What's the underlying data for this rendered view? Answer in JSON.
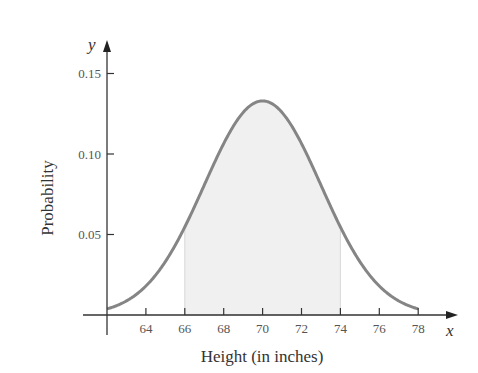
{
  "chart_data": {
    "type": "area",
    "title": "",
    "xlabel": "Height (in inches)",
    "ylabel": "Probability",
    "x_axis_var": "x",
    "y_axis_var": "y",
    "x_ticks": [
      64,
      66,
      68,
      70,
      72,
      74,
      76,
      78
    ],
    "y_ticks": [
      "0.05",
      "0.10",
      "0.15"
    ],
    "xlim": [
      62,
      80
    ],
    "ylim": [
      0,
      0.16
    ],
    "grid": false,
    "legend": null,
    "distribution": {
      "kind": "normal",
      "mean": 70,
      "sd": 3,
      "peak_y": 0.133
    },
    "curve_range": [
      62,
      78
    ],
    "shaded_region": {
      "from": 66,
      "to": 74
    },
    "series": [
      {
        "name": "Normal density",
        "x": [
          62,
          63,
          64,
          65,
          66,
          67,
          68,
          69,
          70,
          71,
          72,
          73,
          74,
          75,
          76,
          77,
          78
        ],
        "values": [
          0.003,
          0.006,
          0.018,
          0.033,
          0.055,
          0.081,
          0.106,
          0.126,
          0.133,
          0.126,
          0.106,
          0.081,
          0.055,
          0.033,
          0.018,
          0.006,
          0.003
        ]
      }
    ]
  },
  "colors": {
    "curve": "#858585",
    "fill": "#f0f0f0",
    "axis": "#333333",
    "text": "#555555"
  }
}
